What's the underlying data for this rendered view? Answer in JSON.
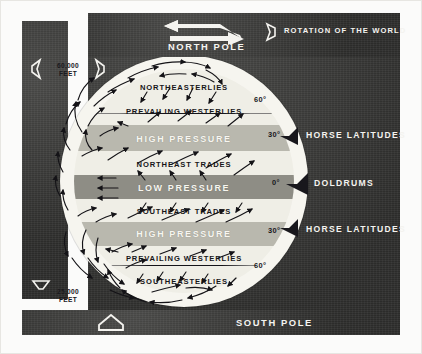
{
  "figure": {
    "type": "meteorological-diagram"
  },
  "top_bar": {
    "pole_label": "NORTH POLE",
    "rotation_label": "ROTATION OF THE WORLD",
    "rotation_arrow_icon": "zigzag-rotation-arrow-icon",
    "rotation_marker_icon": "hollow-diamond-icon"
  },
  "bottom_bar": {
    "pole_label": "SOUTH POLE",
    "arrow_icon": "hollow-up-arrow-icon"
  },
  "altitude": {
    "top": {
      "value": "60,000",
      "unit": "FEET",
      "left_arrow_icon": "hollow-left-arrow-icon",
      "right_arrow_icon": "hollow-right-arrow-icon"
    },
    "bottom": {
      "value": "25,000",
      "unit": "FEET",
      "arrow_icon": "hollow-down-arrow-icon",
      "arrow_icon_2": "hollow-up-arrow-icon"
    }
  },
  "bands": [
    {
      "id": "northeasterlies",
      "label": "NORTHEASTERLIES",
      "tone": "light",
      "text": "dark"
    },
    {
      "id": "prevailing-westerlies-n",
      "label": "PREVAILING WESTERLIES",
      "tone": "light",
      "text": "dark"
    },
    {
      "id": "high-pressure-n",
      "label": "HIGH PRESSURE",
      "tone": "mid",
      "text": "light"
    },
    {
      "id": "northeast-trades",
      "label": "NORTHEAST TRADES",
      "tone": "light",
      "text": "dark"
    },
    {
      "id": "low-pressure",
      "label": "LOW PRESSURE",
      "tone": "dark",
      "text": "light"
    },
    {
      "id": "southeast-trades",
      "label": "SOUTHEAST TRADES",
      "tone": "light",
      "text": "dark"
    },
    {
      "id": "high-pressure-s",
      "label": "HIGH PRESSURE",
      "tone": "mid",
      "text": "light"
    },
    {
      "id": "prevailing-westerlies-s",
      "label": "PREVAILING WESTERLIES",
      "tone": "light",
      "text": "dark"
    },
    {
      "id": "southeasterlies",
      "label": "SOUTHEASTERLIES",
      "tone": "light",
      "text": "dark"
    }
  ],
  "latitudes": [
    {
      "id": "lat-60-n",
      "label": "60°"
    },
    {
      "id": "lat-30-n",
      "label": "30°"
    },
    {
      "id": "lat-0",
      "label": "0°"
    },
    {
      "id": "lat-30-s",
      "label": "30°"
    },
    {
      "id": "lat-60-s",
      "label": "60°"
    }
  ],
  "zone_callouts": [
    {
      "id": "horse-latitudes-n",
      "label": "HORSE LATITUDES",
      "marker_icon": "black-left-arrow-icon"
    },
    {
      "id": "doldrums",
      "label": "DOLDRUMS",
      "marker_icon": "black-left-arrow-icon"
    },
    {
      "id": "horse-latitudes-s",
      "label": "HORSE LATITUDES",
      "marker_icon": "black-left-arrow-icon"
    }
  ],
  "colors": {
    "panel_dark": "#3a3a38",
    "globe_light": "#efeee6",
    "band_mid": "#b9b8ae",
    "band_dark": "#8e8d85",
    "text_light": "#f5f4f0",
    "text_dark": "#17161a"
  }
}
